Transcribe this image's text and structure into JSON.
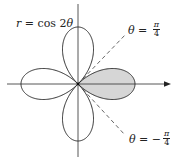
{
  "chart_data": {
    "type": "line",
    "subtype": "polar-rose",
    "title": "",
    "equation": "r = cos 2θ",
    "curve_label": {
      "var": "r",
      "eq": " = cos 2",
      "theta": "θ"
    },
    "petals": 4,
    "petal_directions_deg": [
      0,
      90,
      180,
      270
    ],
    "shaded_region": {
      "description": "right petal, between θ = -π/4 and θ = π/4",
      "theta_range": [
        -0.7854,
        0.7854
      ],
      "color": "#d6d6d6"
    },
    "reference_lines": [
      {
        "label_var": "θ",
        "label_eq": " = ",
        "num": "π",
        "den": "4",
        "theta": 0.7854,
        "style": "dashed"
      },
      {
        "label_var": "θ",
        "label_eq": " = −",
        "num": "π",
        "den": "4",
        "theta": -0.7854,
        "style": "dashed"
      }
    ],
    "axes": {
      "x_arrow": true,
      "y_arrow": false
    },
    "xlabel": "",
    "ylabel": "",
    "grid": false
  },
  "colors": {
    "curve": "#2a2a2a",
    "axis": "#444444",
    "dash": "#555555",
    "shade": "#d6d6d6"
  }
}
